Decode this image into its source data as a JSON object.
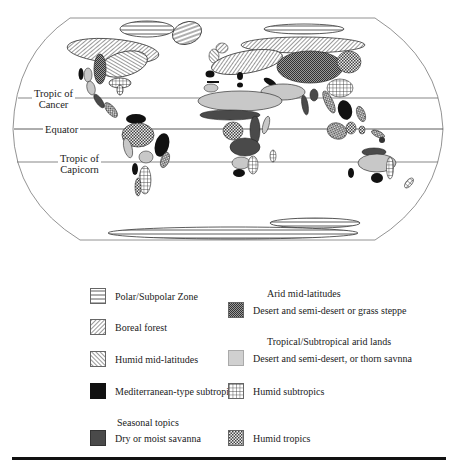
{
  "map": {
    "labels": {
      "tropic_cancer_line1": "Tropic of",
      "tropic_cancer_line2": "Cancer",
      "equator": "Equator",
      "tropic_capricorn_line1": "Tropic of",
      "tropic_capricorn_line2": "Capicorn"
    },
    "lines_y": {
      "tropic_cancer": 98,
      "equator": 129,
      "tropic_capricorn": 162
    }
  },
  "legend": {
    "left": [
      {
        "id": "polar",
        "label": "Polar/Subpolar Zone",
        "pattern": "horizontal-lines"
      },
      {
        "id": "boreal",
        "label": "Boreal forest",
        "pattern": "diagonal-lines-right"
      },
      {
        "id": "humid-mid",
        "label": "Humid mid-latitudes",
        "pattern": "diagonal-lines-left"
      },
      {
        "id": "mediterranean",
        "label": "Mediterranean-type subtropic",
        "pattern": "solid-black"
      },
      {
        "id": "savanna",
        "heading": "Seasonal topics",
        "label": "Dry or moist savanna",
        "pattern": "solid-dark-gray"
      }
    ],
    "right": [
      {
        "id": "arid-mid",
        "heading": "Arid mid-latitudes",
        "label": "Desert and semi-desert or grass steppe",
        "pattern": "dense-checker"
      },
      {
        "id": "trop-arid",
        "heading": "Tropical/Subtropical arid lands",
        "label": "Desert and semi-desert, or thorn savnna",
        "pattern": "light-gray"
      },
      {
        "id": "humid-sub",
        "label": "Humid subtropics",
        "pattern": "grid"
      },
      {
        "id": "humid-trop",
        "label": "Humid tropics",
        "pattern": "checker"
      }
    ]
  },
  "colors": {
    "solid_black": "#111111",
    "dark_gray": "#4a4a4a",
    "light_gray": "#c8c8c8",
    "outline": "#555555"
  }
}
